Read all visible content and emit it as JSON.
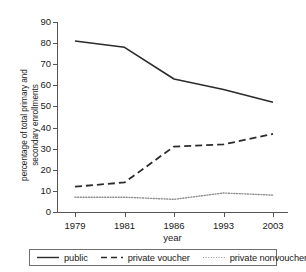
{
  "chart_data": {
    "type": "line",
    "title": "",
    "xlabel": "year",
    "ylabel": "percentage of total primary and secondary enrollments",
    "ylabel_line1": "percentage of total primary and",
    "ylabel_line2": "secondary enrollments",
    "categories": [
      "1979",
      "1981",
      "1986",
      "1993",
      "2003"
    ],
    "x": [
      1979,
      1981,
      1986,
      1993,
      2003
    ],
    "ylim": [
      0,
      90
    ],
    "yticks": [
      0,
      10,
      20,
      30,
      40,
      50,
      60,
      70,
      80,
      90
    ],
    "ytick_labels": [
      "0",
      "10",
      "20",
      "30",
      "40",
      "50",
      "60",
      "70",
      "80",
      "90"
    ],
    "grid": false,
    "legend_position": "bottom",
    "series": [
      {
        "name": "public",
        "style": "solid",
        "color": "#2b2b2b",
        "values": [
          81,
          78,
          63,
          58,
          52
        ]
      },
      {
        "name": "private voucher",
        "style": "dashed",
        "color": "#2b2b2b",
        "values": [
          12,
          14,
          31,
          32,
          37
        ]
      },
      {
        "name": "private nonvoucher",
        "style": "dotted",
        "color": "#8c8c8c",
        "values": [
          7,
          7,
          6,
          9,
          8
        ]
      }
    ]
  },
  "axes": {
    "y_title_line1": "percentage of total primary and",
    "y_title_line2": "secondary enrollments",
    "x_title": "year",
    "y_ticks": [
      "90",
      "80",
      "70",
      "60",
      "50",
      "40",
      "30",
      "20",
      "10",
      "0"
    ],
    "x_ticks": [
      "1979",
      "1981",
      "1986",
      "1993",
      "2003"
    ]
  },
  "legend": {
    "items": [
      {
        "label": "public",
        "style": "solid"
      },
      {
        "label": "private voucher",
        "style": "dashed"
      },
      {
        "label": "private nonvoucher",
        "style": "dotted"
      }
    ]
  },
  "artifact": {
    "top_right": ""
  }
}
